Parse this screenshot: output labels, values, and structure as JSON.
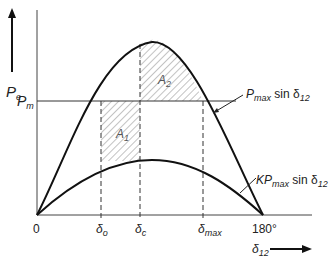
{
  "diagram": {
    "type": "power-angle curve (equal area criterion)",
    "y_axis_label": {
      "main": "P",
      "sub": "e"
    },
    "x_axis_label": {
      "main": "δ",
      "sub": "12"
    },
    "pm_label": {
      "main": "P",
      "sub": "m"
    },
    "x_ticks": [
      {
        "main": "0",
        "sub": ""
      },
      {
        "main": "δ",
        "sub": "o"
      },
      {
        "main": "δ",
        "sub": "c"
      },
      {
        "main": "δ",
        "sub": "max"
      },
      {
        "main": "180°",
        "sub": ""
      }
    ],
    "areas": [
      {
        "main": "A",
        "sub": "1"
      },
      {
        "main": "A",
        "sub": "2"
      }
    ],
    "curves": [
      {
        "pre": "P",
        "sub": "max",
        "post": " sin δ",
        "sub2": "12"
      },
      {
        "pre": "KP",
        "sub": "max",
        "post": " sin δ",
        "sub2": "12"
      }
    ],
    "colors": {
      "line": "#111111",
      "hatch": "#888888",
      "text": "#222222"
    }
  }
}
